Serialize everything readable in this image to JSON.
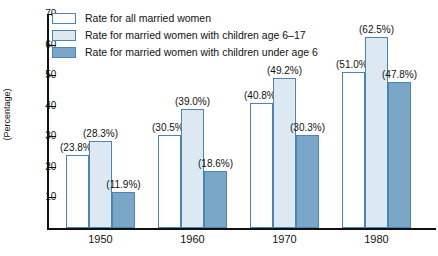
{
  "chart_data": {
    "type": "bar",
    "title": "",
    "xlabel": "",
    "ylabel": "(Percentage)",
    "ylim": [
      0,
      70
    ],
    "yticks": [
      10,
      20,
      30,
      40,
      50,
      60,
      70
    ],
    "ytick_labels": [
      "10",
      "20",
      "30",
      "40",
      "50",
      "60",
      "70"
    ],
    "grid": false,
    "legend_position": "top-left",
    "categories": [
      "1950",
      "1960",
      "1970",
      "1980"
    ],
    "series": [
      {
        "name": "Rate for all married women",
        "key": "all-married-women",
        "fill": "#ffffff",
        "border": "#4a86b4",
        "values": [
          23.8,
          30.5,
          40.8,
          51.0
        ],
        "labels": [
          "(23.8%)",
          "(30.5%)",
          "(40.8%)",
          "(51.0%)"
        ]
      },
      {
        "name": "Rate for married women with children age 6–17",
        "key": "children-age-6-17",
        "fill": "#dce9f2",
        "border": "#4a86b4",
        "values": [
          28.3,
          39.0,
          49.2,
          62.5
        ],
        "labels": [
          "(28.3%)",
          "(39.0%)",
          "(49.2%)",
          "(62.5%)"
        ]
      },
      {
        "name": "Rate for married women with children under age 6",
        "key": "children-under-age-6",
        "fill": "#7aa7c7",
        "border": "#4a86b4",
        "values": [
          11.9,
          18.6,
          30.3,
          47.8
        ],
        "labels": [
          "(11.9%)",
          "(18.6%)",
          "(30.3%)",
          "(47.8%)"
        ]
      }
    ]
  },
  "colors": {
    "axis": "#111111",
    "bar_border": "#4a86b4",
    "series_1_fill": "#ffffff",
    "series_2_fill": "#dce9f2",
    "series_3_fill": "#7aa7c7"
  }
}
